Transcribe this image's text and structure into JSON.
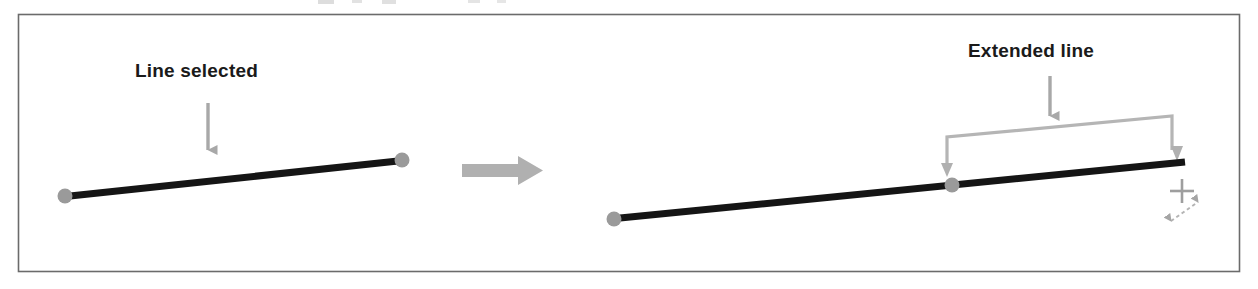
{
  "figure": {
    "title_fragment_visible": false,
    "background_color": "#ffffff",
    "border_color": "#6b6b6b",
    "frame": {
      "x": 18,
      "y": 14,
      "width": 1222,
      "height": 258
    },
    "labels": {
      "line_selected": "Line selected",
      "extended_line": "Extended line"
    },
    "colors": {
      "line_stroke": "#151515",
      "grip_dot": "#9a9a9a",
      "annotation_gray": "#a8a8a8",
      "bracket_gray": "#b5b5b5",
      "cursor_gray": "#9e9e9e",
      "text": "#1a1a1a"
    },
    "before_panel": {
      "name": "before-state",
      "line": {
        "x1": 70,
        "y1": 196,
        "x2": 398,
        "y2": 161
      },
      "grips": [
        {
          "cx": 65,
          "cy": 196,
          "r": 7
        },
        {
          "cx": 402,
          "cy": 160,
          "r": 7
        }
      ],
      "callout_arrow": {
        "x": 208,
        "y1": 103,
        "y2": 158
      }
    },
    "transition_arrow": {
      "name": "transition-arrow",
      "direction": "right",
      "shaft": {
        "x": 462,
        "y": 164,
        "width": 58,
        "height": 11
      },
      "head": {
        "x": 518,
        "y_center": 170,
        "width": 24,
        "height": 28
      }
    },
    "after_panel": {
      "name": "after-state",
      "line": {
        "x1": 620,
        "y1": 218,
        "x2": 1185,
        "y2": 162
      },
      "grips": [
        {
          "cx": 614,
          "cy": 219,
          "r": 7
        },
        {
          "cx": 952,
          "cy": 185,
          "r": 7
        }
      ],
      "extension_bracket": {
        "top_left": {
          "x": 947,
          "y": 137
        },
        "top_right": {
          "x": 1172,
          "y": 116
        },
        "left_arrow_tip": {
          "x": 947,
          "y": 176
        },
        "right_arrow_tip": {
          "x": 1177,
          "y": 160
        }
      },
      "callout_arrow": {
        "x": 1050,
        "y1": 76,
        "y2": 124
      },
      "cursor": {
        "name": "resize-crosshair-cursor",
        "crosshair_center": {
          "x": 1182,
          "y": 191
        },
        "crosshair_arm": 11,
        "diagonal_arrow": {
          "x1": 1167,
          "y1": 224,
          "x2": 1201,
          "y2": 200
        }
      }
    }
  }
}
